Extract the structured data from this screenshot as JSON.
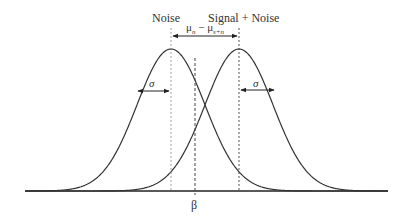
{
  "title_labels": {
    "noise": "Noise",
    "signal_noise": "Signal + Noise"
  },
  "annotations": {
    "mean_difference": "μn − μs+n",
    "mean_difference_parts": {
      "mu": "μ",
      "sub_n": "n",
      "minus": " − ",
      "sub_sn": "s+n"
    },
    "sigma_left": "σ",
    "sigma_right": "σ",
    "criterion": "β"
  },
  "geometry": {
    "baseline_y": 191,
    "baseline_x": [
      25,
      388
    ],
    "peak_y": 49,
    "noise_mean_x": 171,
    "signal_mean_x": 239,
    "criterion_x": 195,
    "sigma_px": 34
  },
  "colors": {
    "curve": "#333333",
    "baseline": "#222222",
    "dashed": "#444444",
    "dotted": "#888888"
  }
}
